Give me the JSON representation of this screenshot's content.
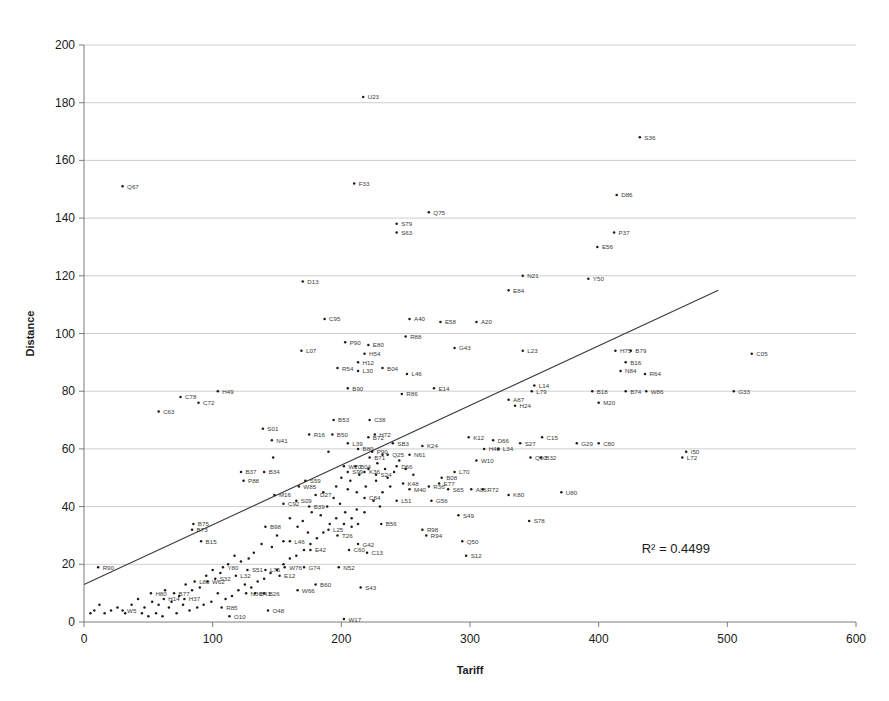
{
  "chart_data": {
    "type": "scatter",
    "title": "",
    "xlabel": "Tariff",
    "ylabel": "Distance",
    "xlim": [
      0,
      600
    ],
    "ylim": [
      0,
      200
    ],
    "xticks": [
      0,
      100,
      200,
      300,
      400,
      500,
      600
    ],
    "yticks": [
      0,
      20,
      40,
      60,
      80,
      100,
      120,
      140,
      160,
      180,
      200
    ],
    "grid": "horizontal",
    "legend": "none",
    "annotations": [
      {
        "text": "R² = 0.4499",
        "x": 460,
        "y": 24
      }
    ],
    "trendline": {
      "type": "linear",
      "x0": 0,
      "y0": 13,
      "x1": 493,
      "y1": 115,
      "r_squared": 0.4499
    },
    "point_label_key": "label",
    "points": [
      {
        "label": "U23",
        "x": 217,
        "y": 182
      },
      {
        "label": "S36",
        "x": 432,
        "y": 168
      },
      {
        "label": "Q67",
        "x": 30,
        "y": 151
      },
      {
        "label": "F33",
        "x": 210,
        "y": 152
      },
      {
        "label": "D86",
        "x": 414,
        "y": 148
      },
      {
        "label": "Q75",
        "x": 268,
        "y": 142
      },
      {
        "label": "S79",
        "x": 243,
        "y": 138
      },
      {
        "label": "S63",
        "x": 243,
        "y": 135
      },
      {
        "label": "P37",
        "x": 412,
        "y": 135
      },
      {
        "label": "E56",
        "x": 399,
        "y": 130
      },
      {
        "label": "D13",
        "x": 170,
        "y": 118
      },
      {
        "label": "N21",
        "x": 341,
        "y": 120
      },
      {
        "label": "Y50",
        "x": 392,
        "y": 119
      },
      {
        "label": "E84",
        "x": 330,
        "y": 115
      },
      {
        "label": "C95",
        "x": 187,
        "y": 105
      },
      {
        "label": "A40",
        "x": 253,
        "y": 105
      },
      {
        "label": "E58",
        "x": 277,
        "y": 104
      },
      {
        "label": "A20",
        "x": 305,
        "y": 104
      },
      {
        "label": "R88",
        "x": 250,
        "y": 99
      },
      {
        "label": "P90",
        "x": 203,
        "y": 97
      },
      {
        "label": "E80",
        "x": 221,
        "y": 96
      },
      {
        "label": "L07",
        "x": 169,
        "y": 94
      },
      {
        "label": "H54",
        "x": 218,
        "y": 93
      },
      {
        "label": "H12",
        "x": 213,
        "y": 90
      },
      {
        "label": "G43",
        "x": 288,
        "y": 95
      },
      {
        "label": "L23",
        "x": 341,
        "y": 94
      },
      {
        "label": "H75",
        "x": 413,
        "y": 94
      },
      {
        "label": "B79",
        "x": 425,
        "y": 94
      },
      {
        "label": "C05",
        "x": 519,
        "y": 93
      },
      {
        "label": "R54",
        "x": 197,
        "y": 88
      },
      {
        "label": "L30",
        "x": 213,
        "y": 87
      },
      {
        "label": "B04",
        "x": 232,
        "y": 88
      },
      {
        "label": "B16",
        "x": 421,
        "y": 90
      },
      {
        "label": "N84",
        "x": 417,
        "y": 87
      },
      {
        "label": "R64",
        "x": 436,
        "y": 86
      },
      {
        "label": "L46",
        "x": 251,
        "y": 86
      },
      {
        "label": "B90",
        "x": 205,
        "y": 81
      },
      {
        "label": "H49",
        "x": 104,
        "y": 80
      },
      {
        "label": "E14",
        "x": 272,
        "y": 81
      },
      {
        "label": "L79",
        "x": 348,
        "y": 80
      },
      {
        "label": "L14",
        "x": 350,
        "y": 82
      },
      {
        "label": "B18",
        "x": 395,
        "y": 80
      },
      {
        "label": "B74",
        "x": 421,
        "y": 80
      },
      {
        "label": "W86",
        "x": 437,
        "y": 80
      },
      {
        "label": "G33",
        "x": 505,
        "y": 80
      },
      {
        "label": "R86",
        "x": 247,
        "y": 79
      },
      {
        "label": "C78",
        "x": 75,
        "y": 78
      },
      {
        "label": "C72",
        "x": 89,
        "y": 76
      },
      {
        "label": "A87",
        "x": 330,
        "y": 77
      },
      {
        "label": "H24",
        "x": 335,
        "y": 75
      },
      {
        "label": "M20",
        "x": 400,
        "y": 76
      },
      {
        "label": "C63",
        "x": 58,
        "y": 73
      },
      {
        "label": "B53",
        "x": 194,
        "y": 70
      },
      {
        "label": "C38",
        "x": 222,
        "y": 70
      },
      {
        "label": "S01",
        "x": 139,
        "y": 67
      },
      {
        "label": "R16",
        "x": 175,
        "y": 65
      },
      {
        "label": "B50",
        "x": 193,
        "y": 65
      },
      {
        "label": "H72",
        "x": 226,
        "y": 65
      },
      {
        "label": "B72",
        "x": 221,
        "y": 64
      },
      {
        "label": "K12",
        "x": 299,
        "y": 64
      },
      {
        "label": "C15",
        "x": 356,
        "y": 64
      },
      {
        "label": "D66",
        "x": 318,
        "y": 63
      },
      {
        "label": "N41",
        "x": 146,
        "y": 63
      },
      {
        "label": "L39",
        "x": 205,
        "y": 62
      },
      {
        "label": "SB3",
        "x": 240,
        "y": 62
      },
      {
        "label": "K24",
        "x": 263,
        "y": 61
      },
      {
        "label": "S27",
        "x": 339,
        "y": 62
      },
      {
        "label": "G29",
        "x": 383,
        "y": 62
      },
      {
        "label": "C80",
        "x": 400,
        "y": 62
      },
      {
        "label": "B80",
        "x": 213,
        "y": 60
      },
      {
        "label": "P90",
        "x": 224,
        "y": 59
      },
      {
        "label": "Q25",
        "x": 236,
        "y": 58
      },
      {
        "label": "N61",
        "x": 253,
        "y": 58
      },
      {
        "label": "H40",
        "x": 311,
        "y": 60
      },
      {
        "label": "L34",
        "x": 322,
        "y": 60
      },
      {
        "label": "I50",
        "x": 468,
        "y": 59
      },
      {
        "label": "L72",
        "x": 465,
        "y": 57
      },
      {
        "label": "B32",
        "x": 355,
        "y": 57
      },
      {
        "label": "B71",
        "x": 222,
        "y": 57
      },
      {
        "label": "W10",
        "x": 305,
        "y": 56
      },
      {
        "label": "Q90",
        "x": 347,
        "y": 57
      },
      {
        "label": "B37",
        "x": 122,
        "y": 52
      },
      {
        "label": "B34",
        "x": 140,
        "y": 52
      },
      {
        "label": "W20",
        "x": 202,
        "y": 54
      },
      {
        "label": "B04",
        "x": 211,
        "y": 54
      },
      {
        "label": "S99",
        "x": 205,
        "y": 52
      },
      {
        "label": "K36",
        "x": 218,
        "y": 52
      },
      {
        "label": "S24",
        "x": 227,
        "y": 51
      },
      {
        "label": "D66",
        "x": 243,
        "y": 54
      },
      {
        "label": "L70",
        "x": 288,
        "y": 52
      },
      {
        "label": "P88",
        "x": 124,
        "y": 49
      },
      {
        "label": "S59",
        "x": 172,
        "y": 49
      },
      {
        "label": "K48",
        "x": 248,
        "y": 48
      },
      {
        "label": "E77",
        "x": 276,
        "y": 48
      },
      {
        "label": "M40",
        "x": 253,
        "y": 46
      },
      {
        "label": "W85",
        "x": 167,
        "y": 47
      },
      {
        "label": "B08",
        "x": 278,
        "y": 50
      },
      {
        "label": "R36",
        "x": 268,
        "y": 47
      },
      {
        "label": "S65",
        "x": 283,
        "y": 46
      },
      {
        "label": "A86",
        "x": 301,
        "y": 46
      },
      {
        "label": "R72",
        "x": 310,
        "y": 46
      },
      {
        "label": "K80",
        "x": 330,
        "y": 44
      },
      {
        "label": "U80",
        "x": 371,
        "y": 45
      },
      {
        "label": "M16",
        "x": 148,
        "y": 44
      },
      {
        "label": "D27",
        "x": 180,
        "y": 44
      },
      {
        "label": "C84",
        "x": 218,
        "y": 43
      },
      {
        "label": "L51",
        "x": 243,
        "y": 42
      },
      {
        "label": "G56",
        "x": 270,
        "y": 42
      },
      {
        "label": "S09",
        "x": 165,
        "y": 42
      },
      {
        "label": "C92",
        "x": 155,
        "y": 41
      },
      {
        "label": "B39",
        "x": 175,
        "y": 40
      },
      {
        "label": "S49",
        "x": 291,
        "y": 37
      },
      {
        "label": "S78",
        "x": 346,
        "y": 35
      },
      {
        "label": "B75",
        "x": 85,
        "y": 34
      },
      {
        "label": "B73",
        "x": 84,
        "y": 32
      },
      {
        "label": "B56",
        "x": 231,
        "y": 34
      },
      {
        "label": "B98",
        "x": 141,
        "y": 33
      },
      {
        "label": "L25",
        "x": 190,
        "y": 32
      },
      {
        "label": "R98",
        "x": 263,
        "y": 32
      },
      {
        "label": "R94",
        "x": 266,
        "y": 30
      },
      {
        "label": "T26",
        "x": 197,
        "y": 30
      },
      {
        "label": "B15",
        "x": 91,
        "y": 28
      },
      {
        "label": "Q50",
        "x": 294,
        "y": 28
      },
      {
        "label": "L46",
        "x": 160,
        "y": 28
      },
      {
        "label": "G42",
        "x": 213,
        "y": 27
      },
      {
        "label": "C60",
        "x": 206,
        "y": 25
      },
      {
        "label": "E42",
        "x": 176,
        "y": 25
      },
      {
        "label": "S12",
        "x": 297,
        "y": 23
      },
      {
        "label": "C13",
        "x": 220,
        "y": 24
      },
      {
        "label": "R90",
        "x": 11,
        "y": 19
      },
      {
        "label": "Y80",
        "x": 108,
        "y": 19
      },
      {
        "label": "W76",
        "x": 156,
        "y": 19
      },
      {
        "label": "G74",
        "x": 171,
        "y": 19
      },
      {
        "label": "N52",
        "x": 198,
        "y": 19
      },
      {
        "label": "S51",
        "x": 127,
        "y": 18
      },
      {
        "label": "L75",
        "x": 141,
        "y": 18
      },
      {
        "label": "L32",
        "x": 118,
        "y": 16
      },
      {
        "label": "E12",
        "x": 152,
        "y": 16
      },
      {
        "label": "S32",
        "x": 102,
        "y": 15
      },
      {
        "label": "W62",
        "x": 96,
        "y": 14
      },
      {
        "label": "L80",
        "x": 86,
        "y": 14
      },
      {
        "label": "B60",
        "x": 180,
        "y": 13
      },
      {
        "label": "S43",
        "x": 215,
        "y": 12
      },
      {
        "label": "W66",
        "x": 166,
        "y": 11
      },
      {
        "label": "N36",
        "x": 126,
        "y": 10
      },
      {
        "label": "B26",
        "x": 140,
        "y": 10
      },
      {
        "label": "B43",
        "x": 133,
        "y": 10
      },
      {
        "label": "B77",
        "x": 70,
        "y": 10
      },
      {
        "label": "H80",
        "x": 52,
        "y": 10
      },
      {
        "label": "H14",
        "x": 62,
        "y": 8
      },
      {
        "label": "H37",
        "x": 78,
        "y": 8
      },
      {
        "label": "R85",
        "x": 107,
        "y": 5
      },
      {
        "label": "W5",
        "x": 30,
        "y": 4
      },
      {
        "label": "O48",
        "x": 143,
        "y": 4
      },
      {
        "label": "O10",
        "x": 113,
        "y": 2
      },
      {
        "label": "W17",
        "x": 202,
        "y": 1
      },
      {
        "label": "_a1",
        "x": 186,
        "y": 45
      },
      {
        "label": "",
        "x": 147,
        "y": 57
      },
      {
        "label": "",
        "x": 190,
        "y": 59
      },
      {
        "label": "",
        "x": 196,
        "y": 47
      },
      {
        "label": "",
        "x": 205,
        "y": 46
      },
      {
        "label": "",
        "x": 212,
        "y": 45
      },
      {
        "label": "",
        "x": 219,
        "y": 47
      },
      {
        "label": "",
        "x": 227,
        "y": 49
      },
      {
        "label": "",
        "x": 232,
        "y": 45
      },
      {
        "label": "",
        "x": 238,
        "y": 47
      },
      {
        "label": "",
        "x": 177,
        "y": 38
      },
      {
        "label": "",
        "x": 184,
        "y": 37
      },
      {
        "label": "",
        "x": 189,
        "y": 40
      },
      {
        "label": "",
        "x": 194,
        "y": 43
      },
      {
        "label": "",
        "x": 199,
        "y": 41
      },
      {
        "label": "",
        "x": 203,
        "y": 38
      },
      {
        "label": "",
        "x": 208,
        "y": 36
      },
      {
        "label": "",
        "x": 212,
        "y": 39
      },
      {
        "label": "",
        "x": 160,
        "y": 36
      },
      {
        "label": "",
        "x": 166,
        "y": 33
      },
      {
        "label": "",
        "x": 170,
        "y": 35
      },
      {
        "label": "",
        "x": 174,
        "y": 31
      },
      {
        "label": "",
        "x": 150,
        "y": 30
      },
      {
        "label": "",
        "x": 155,
        "y": 28
      },
      {
        "label": "",
        "x": 146,
        "y": 26
      },
      {
        "label": "",
        "x": 138,
        "y": 27
      },
      {
        "label": "",
        "x": 132,
        "y": 24
      },
      {
        "label": "",
        "x": 128,
        "y": 22
      },
      {
        "label": "",
        "x": 122,
        "y": 21
      },
      {
        "label": "",
        "x": 117,
        "y": 23
      },
      {
        "label": "",
        "x": 112,
        "y": 20
      },
      {
        "label": "",
        "x": 106,
        "y": 17
      },
      {
        "label": "",
        "x": 100,
        "y": 18
      },
      {
        "label": "",
        "x": 95,
        "y": 16
      },
      {
        "label": "",
        "x": 90,
        "y": 12
      },
      {
        "label": "",
        "x": 84,
        "y": 11
      },
      {
        "label": "",
        "x": 79,
        "y": 13
      },
      {
        "label": "",
        "x": 74,
        "y": 9
      },
      {
        "label": "",
        "x": 68,
        "y": 7
      },
      {
        "label": "",
        "x": 63,
        "y": 11
      },
      {
        "label": "",
        "x": 58,
        "y": 6
      },
      {
        "label": "",
        "x": 53,
        "y": 7
      },
      {
        "label": "",
        "x": 47,
        "y": 5
      },
      {
        "label": "",
        "x": 42,
        "y": 8
      },
      {
        "label": "",
        "x": 37,
        "y": 6
      },
      {
        "label": "",
        "x": 32,
        "y": 3
      },
      {
        "label": "",
        "x": 26,
        "y": 5
      },
      {
        "label": "",
        "x": 21,
        "y": 4
      },
      {
        "label": "",
        "x": 16,
        "y": 3
      },
      {
        "label": "",
        "x": 12,
        "y": 6
      },
      {
        "label": "",
        "x": 8,
        "y": 4
      },
      {
        "label": "",
        "x": 5,
        "y": 3
      },
      {
        "label": "",
        "x": 232,
        "y": 58
      },
      {
        "label": "",
        "x": 245,
        "y": 56
      },
      {
        "label": "",
        "x": 250,
        "y": 53
      },
      {
        "label": "",
        "x": 256,
        "y": 51
      },
      {
        "label": "",
        "x": 236,
        "y": 50
      },
      {
        "label": "",
        "x": 241,
        "y": 52
      },
      {
        "label": "",
        "x": 225,
        "y": 42
      },
      {
        "label": "",
        "x": 230,
        "y": 40
      },
      {
        "label": "",
        "x": 218,
        "y": 38
      },
      {
        "label": "",
        "x": 213,
        "y": 34
      },
      {
        "label": "",
        "x": 208,
        "y": 33
      },
      {
        "label": "",
        "x": 202,
        "y": 34
      },
      {
        "label": "",
        "x": 196,
        "y": 36
      },
      {
        "label": "",
        "x": 191,
        "y": 34
      },
      {
        "label": "",
        "x": 186,
        "y": 31
      },
      {
        "label": "",
        "x": 181,
        "y": 29
      },
      {
        "label": "",
        "x": 176,
        "y": 27
      },
      {
        "label": "",
        "x": 171,
        "y": 25
      },
      {
        "label": "",
        "x": 165,
        "y": 23
      },
      {
        "label": "",
        "x": 160,
        "y": 22
      },
      {
        "label": "",
        "x": 155,
        "y": 20
      },
      {
        "label": "",
        "x": 150,
        "y": 18
      },
      {
        "label": "",
        "x": 145,
        "y": 17
      },
      {
        "label": "",
        "x": 140,
        "y": 15
      },
      {
        "label": "",
        "x": 135,
        "y": 14
      },
      {
        "label": "",
        "x": 130,
        "y": 12
      },
      {
        "label": "",
        "x": 125,
        "y": 13
      },
      {
        "label": "",
        "x": 120,
        "y": 11
      },
      {
        "label": "",
        "x": 115,
        "y": 9
      },
      {
        "label": "",
        "x": 110,
        "y": 8
      },
      {
        "label": "",
        "x": 104,
        "y": 10
      },
      {
        "label": "",
        "x": 99,
        "y": 7
      },
      {
        "label": "",
        "x": 93,
        "y": 6
      },
      {
        "label": "",
        "x": 88,
        "y": 5
      },
      {
        "label": "",
        "x": 82,
        "y": 4
      },
      {
        "label": "",
        "x": 77,
        "y": 6
      },
      {
        "label": "",
        "x": 72,
        "y": 3
      },
      {
        "label": "",
        "x": 66,
        "y": 5
      },
      {
        "label": "",
        "x": 61,
        "y": 2
      },
      {
        "label": "",
        "x": 56,
        "y": 3
      },
      {
        "label": "",
        "x": 50,
        "y": 2
      },
      {
        "label": "",
        "x": 45,
        "y": 3
      },
      {
        "label": "",
        "x": 200,
        "y": 50
      },
      {
        "label": "",
        "x": 207,
        "y": 49
      },
      {
        "label": "",
        "x": 214,
        "y": 51
      },
      {
        "label": "",
        "x": 221,
        "y": 53
      },
      {
        "label": "",
        "x": 228,
        "y": 55
      },
      {
        "label": "",
        "x": 234,
        "y": 53
      }
    ]
  }
}
